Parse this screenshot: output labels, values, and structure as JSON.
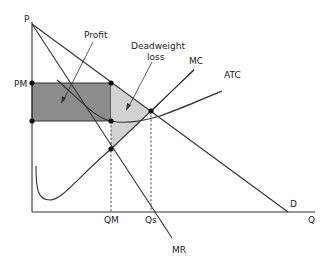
{
  "diagram": {
    "axes": {
      "y_label": "P",
      "x_label": "Q"
    },
    "price_labels": {
      "pm": "PM"
    },
    "quantity_labels": {
      "qm": "QM",
      "qs": "Qs"
    },
    "curves": {
      "demand": "D",
      "marginal_revenue": "MR",
      "marginal_cost": "MC",
      "average_total_cost": "ATC"
    },
    "regions": {
      "profit": "Profit",
      "deadweight_loss_line1": "Deadweight",
      "deadweight_loss_line2": "loss"
    },
    "colors": {
      "profit_fill": "#8c8c8c",
      "deadweight_fill": "#d2d2d2",
      "line": "#333333",
      "background": "#ffffff"
    }
  }
}
